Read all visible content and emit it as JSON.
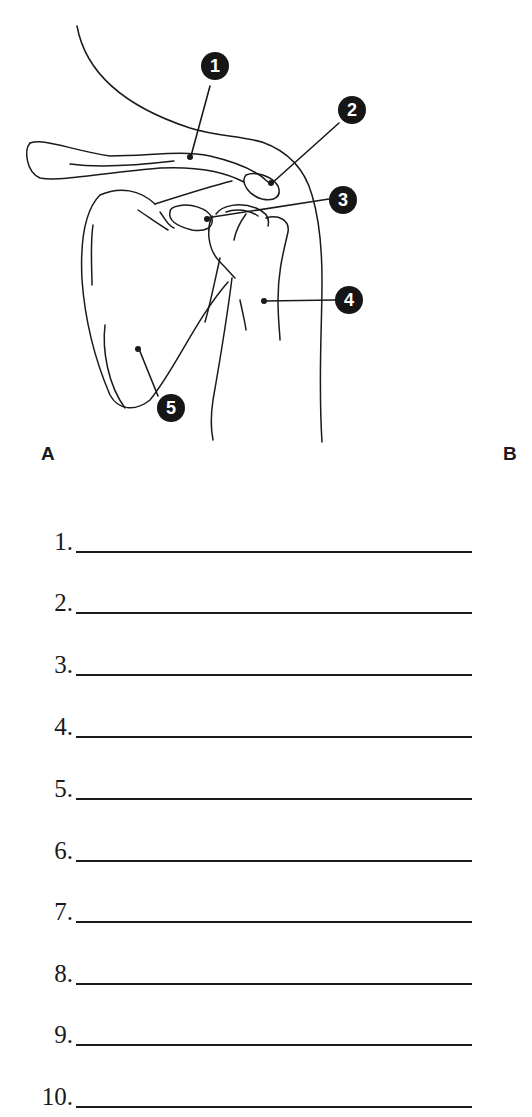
{
  "figure": {
    "panel_labels": {
      "a": "A",
      "b": "B"
    },
    "callouts": [
      {
        "number": "1"
      },
      {
        "number": "2"
      },
      {
        "number": "3"
      },
      {
        "number": "4"
      },
      {
        "number": "5"
      }
    ]
  },
  "answers": {
    "items": [
      {
        "number": "1."
      },
      {
        "number": "2."
      },
      {
        "number": "3."
      },
      {
        "number": "4."
      },
      {
        "number": "5."
      },
      {
        "number": "6."
      },
      {
        "number": "7."
      },
      {
        "number": "8."
      },
      {
        "number": "9."
      },
      {
        "number": "10."
      }
    ]
  }
}
